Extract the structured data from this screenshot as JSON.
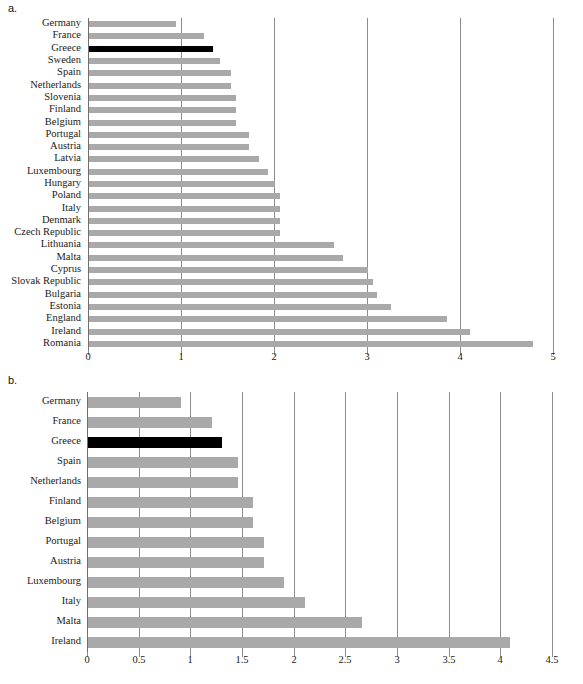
{
  "figure": {
    "panels": [
      {
        "key": "a",
        "label": "a."
      },
      {
        "key": "b",
        "label": "b."
      }
    ]
  },
  "chart_data": [
    {
      "panel": "a",
      "type": "bar",
      "orientation": "horizontal",
      "title": "",
      "xlabel": "",
      "ylabel": "",
      "xlim": [
        0,
        5
      ],
      "xticks": [
        0,
        1,
        2,
        3,
        4,
        5
      ],
      "xticklabels": [
        "0",
        "1",
        "2",
        "3",
        "4",
        "5"
      ],
      "grid": true,
      "grid_axis": "x",
      "legend": "none",
      "bar_color": "#a9a9a9",
      "highlight_color": "#000000",
      "highlight_category": "Greece",
      "categories": [
        "Germany",
        "France",
        "Greece",
        "Sweden",
        "Spain",
        "Netherlands",
        "Slovenia",
        "Finland",
        "Belgium",
        "Portugal",
        "Austria",
        "Latvia",
        "Luxembourg",
        "Hungary",
        "Poland",
        "Italy",
        "Denmark",
        "Czech Republic",
        "Lithuania",
        "Malta",
        "Cyprus",
        "Slovak Republic",
        "Bulgaria",
        "Estonia",
        "England",
        "Ireland",
        "Romania"
      ],
      "values": [
        0.94,
        1.24,
        1.33,
        1.41,
        1.53,
        1.53,
        1.58,
        1.58,
        1.58,
        1.72,
        1.72,
        1.83,
        1.93,
        2.0,
        2.05,
        2.05,
        2.05,
        2.05,
        2.63,
        2.73,
        3.0,
        3.05,
        3.1,
        3.25,
        3.85,
        4.1,
        4.77
      ]
    },
    {
      "panel": "b",
      "type": "bar",
      "orientation": "horizontal",
      "title": "",
      "xlabel": "",
      "ylabel": "",
      "xlim": [
        0,
        4.5
      ],
      "xticks": [
        0,
        0.5,
        1,
        1.5,
        2,
        2.5,
        3,
        3.5,
        4,
        4.5
      ],
      "xticklabels": [
        "0",
        "0.5",
        "1",
        "1.5",
        "2",
        "2.5",
        "3",
        "3.5",
        "4",
        "4.5"
      ],
      "grid": true,
      "grid_axis": "x",
      "legend": "none",
      "bar_color": "#a9a9a9",
      "highlight_color": "#000000",
      "highlight_category": "Greece",
      "categories": [
        "Germany",
        "France",
        "Greece",
        "Spain",
        "Netherlands",
        "Finland",
        "Belgium",
        "Portugal",
        "Austria",
        "Luxembourg",
        "Italy",
        "Malta",
        "Ireland"
      ],
      "values": [
        0.9,
        1.2,
        1.3,
        1.45,
        1.45,
        1.6,
        1.6,
        1.7,
        1.7,
        1.9,
        2.1,
        2.65,
        4.08
      ]
    }
  ]
}
